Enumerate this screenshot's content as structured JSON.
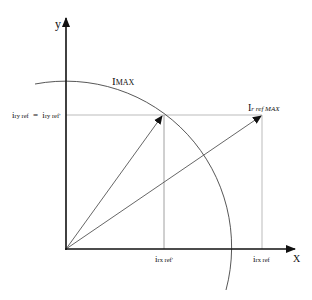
{
  "diagram": {
    "axes": {
      "x_label": "X",
      "y_label": "y"
    },
    "circle_label": {
      "main": "I",
      "sub": "MAX"
    },
    "vector_label": {
      "main": "I",
      "sub": "r ref MAX"
    },
    "y_ref_label": {
      "left_main": "i",
      "left_sub": "ry ref",
      "eq": "=",
      "right_main": "i",
      "right_sub": "ry ref'"
    },
    "x_ref_prime_label": {
      "main": "i",
      "sub": "rx ref'"
    },
    "x_ref_label": {
      "main": "i",
      "sub": "rx ref"
    },
    "colors": {
      "axis": "#111111",
      "line": "#555555",
      "guide": "#999999"
    }
  }
}
